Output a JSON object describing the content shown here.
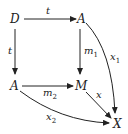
{
  "diagram": {
    "type": "commutative-diagram",
    "nodes": {
      "top_left": "D",
      "top_right": "A",
      "mid_left": "A",
      "mid_center": "M",
      "bottom_right": "X"
    },
    "arrows": [
      {
        "from": "D",
        "to": "A (top)",
        "label": "t"
      },
      {
        "from": "D",
        "to": "A (left)",
        "label": "t"
      },
      {
        "from": "A (top)",
        "to": "M",
        "label": "m",
        "label_sub": "1"
      },
      {
        "from": "A (left)",
        "to": "M",
        "label": "m",
        "label_sub": "2"
      },
      {
        "from": "M",
        "to": "X",
        "label": "x"
      },
      {
        "from": "A (top)",
        "to": "X",
        "label": "x",
        "label_sub": "1",
        "curved": true
      },
      {
        "from": "A (left)",
        "to": "X",
        "label": "x",
        "label_sub": "2",
        "curved": true
      }
    ]
  }
}
